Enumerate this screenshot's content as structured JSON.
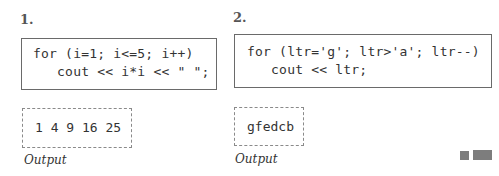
{
  "examples": [
    {
      "number": "1.",
      "code": [
        "for (i=1; i<=5; i++)",
        "   cout << i*i << \" \";"
      ],
      "output": "1 4 9 16 25",
      "output_label": "Output"
    },
    {
      "number": "2.",
      "code": [
        "for (ltr='g'; ltr>'a'; ltr--)",
        "   cout << ltr;"
      ],
      "output": "gfedcb",
      "output_label": "Output"
    }
  ],
  "decor": {
    "square_color": "#7d7d7d"
  }
}
